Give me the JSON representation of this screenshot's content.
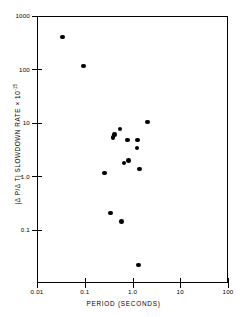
{
  "chart_data": {
    "type": "scatter",
    "title": "",
    "xlabel": "PERIOD (SECONDS)",
    "ylabel": "|Δ P/Δ T| SLOWDOWN RATE × 10",
    "ylabel_exponent": "-15",
    "xscale": "log",
    "yscale": "log",
    "xlim": [
      0.01,
      100
    ],
    "ylim": [
      0.01,
      1000
    ],
    "grid": false,
    "legend": null,
    "xticks": [
      "0.01",
      "0.1",
      "1.0",
      "10",
      "100"
    ],
    "xtick_values": [
      0.01,
      0.1,
      1.0,
      10,
      100
    ],
    "yticks": [
      "1000",
      "100",
      "10",
      "1.0",
      "0.1"
    ],
    "ytick_values": [
      1000,
      100,
      10,
      1.0,
      0.1
    ],
    "marker": "filled-circle",
    "marker_color": "#000000",
    "points": [
      {
        "x": 0.033,
        "y": 420.0
      },
      {
        "x": 0.089,
        "y": 120.0
      },
      {
        "x": 1.96,
        "y": 10.8
      },
      {
        "x": 0.52,
        "y": 8.0
      },
      {
        "x": 0.4,
        "y": 6.3
      },
      {
        "x": 0.37,
        "y": 5.6
      },
      {
        "x": 0.74,
        "y": 5.0
      },
      {
        "x": 1.22,
        "y": 5.0
      },
      {
        "x": 1.18,
        "y": 3.5
      },
      {
        "x": 0.78,
        "y": 2.05
      },
      {
        "x": 0.63,
        "y": 1.83
      },
      {
        "x": 1.33,
        "y": 1.42
      },
      {
        "x": 0.25,
        "y": 1.2
      },
      {
        "x": 0.33,
        "y": 0.215
      },
      {
        "x": 0.56,
        "y": 0.148
      },
      {
        "x": 1.26,
        "y": 0.0225
      }
    ],
    "point_count": 16
  },
  "axes": {
    "x_title": "PERIOD (SECONDS)",
    "y_title_main": "|Δ P/Δ T| SLOWDOWN RATE × 10",
    "y_title_sup": "-15"
  }
}
